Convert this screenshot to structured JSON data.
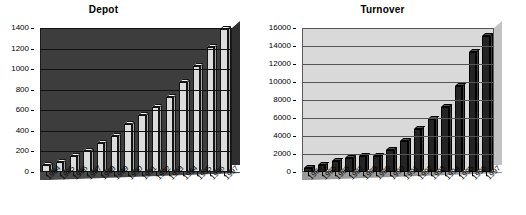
{
  "chart_data": [
    {
      "type": "bar",
      "title": "Depot",
      "xlabel": "",
      "ylabel": "",
      "categories": [
        "1984",
        "1985",
        "1986",
        "1987",
        "1988",
        "1989",
        "1990",
        "1991",
        "1992",
        "1993",
        "1994",
        "1995",
        "1996",
        "1997"
      ],
      "values": [
        70,
        100,
        155,
        205,
        280,
        355,
        465,
        550,
        630,
        725,
        880,
        1030,
        1215,
        1395
      ],
      "ylim": [
        0,
        1400
      ],
      "ytick_step": 200,
      "yticks": [
        "1400",
        "1200",
        "1000",
        "800",
        "600",
        "400",
        "200",
        "0"
      ],
      "grid": true,
      "legend": "none",
      "style": "3d-column",
      "plot_background_color": "#3d3d3d",
      "bar_color": "#dcdcdc"
    },
    {
      "type": "bar",
      "title": "Turnover",
      "xlabel": "",
      "ylabel": "",
      "categories": [
        "1984",
        "1985",
        "1986",
        "1987",
        "1988",
        "1989",
        "1990",
        "1991",
        "1992",
        "1993",
        "1994",
        "1995",
        "1996",
        "1997"
      ],
      "values": [
        500,
        800,
        1250,
        1550,
        1800,
        1800,
        2500,
        3400,
        4750,
        5900,
        7200,
        9600,
        13300,
        15100
      ],
      "ylim": [
        0,
        16000
      ],
      "ytick_step": 2000,
      "yticks": [
        "16000",
        "14000",
        "12000",
        "10000",
        "8000",
        "6000",
        "4000",
        "2000",
        "0"
      ],
      "grid": true,
      "legend": "none",
      "style": "3d-column",
      "plot_background_color": "#d9d9d9",
      "bar_color": "#242424"
    }
  ],
  "charts": {
    "depot": {
      "title": "Depot",
      "yticks": [
        "1400",
        "1200",
        "1000",
        "800",
        "600",
        "400",
        "200",
        "0"
      ],
      "xticks": [
        "1984",
        "1985",
        "1986",
        "1987",
        "1988",
        "1989",
        "1990",
        "1991",
        "1992",
        "1993",
        "1994",
        "1995",
        "1996",
        "1997"
      ]
    },
    "turnover": {
      "title": "Turnover",
      "yticks": [
        "16000",
        "14000",
        "12000",
        "10000",
        "8000",
        "6000",
        "4000",
        "2000",
        "0"
      ],
      "xticks": [
        "1984",
        "1985",
        "1986",
        "1987",
        "1988",
        "1989",
        "1990",
        "1991",
        "1992",
        "1993",
        "1994",
        "1995",
        "1996",
        "1997"
      ]
    }
  }
}
